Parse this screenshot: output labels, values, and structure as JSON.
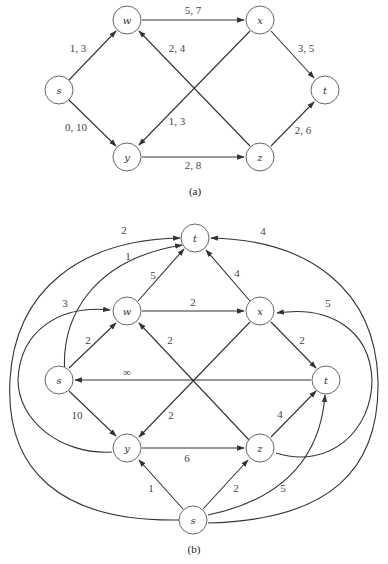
{
  "figure_a": {
    "caption": "(a)",
    "nodes": [
      {
        "id": "s",
        "label": "s"
      },
      {
        "id": "w",
        "label": "w"
      },
      {
        "id": "x",
        "label": "x"
      },
      {
        "id": "t",
        "label": "t"
      },
      {
        "id": "y",
        "label": "y"
      },
      {
        "id": "z",
        "label": "z"
      }
    ],
    "edges": [
      {
        "from": "s",
        "to": "w",
        "label": "1, 3"
      },
      {
        "from": "s",
        "to": "y",
        "label": "0, 10"
      },
      {
        "from": "w",
        "to": "x",
        "label": "5, 7"
      },
      {
        "from": "z",
        "to": "w",
        "label": "2, 4"
      },
      {
        "from": "x",
        "to": "y",
        "label": "1, 3"
      },
      {
        "from": "x",
        "to": "t",
        "label": "3, 5"
      },
      {
        "from": "y",
        "to": "z",
        "label": "2, 8"
      },
      {
        "from": "z",
        "to": "t",
        "label": "2, 6"
      }
    ]
  },
  "figure_b": {
    "caption": "(b)",
    "nodes": [
      {
        "id": "T",
        "label": "t"
      },
      {
        "id": "w",
        "label": "w"
      },
      {
        "id": "x",
        "label": "x"
      },
      {
        "id": "s",
        "label": "s"
      },
      {
        "id": "t",
        "label": "t"
      },
      {
        "id": "y",
        "label": "y"
      },
      {
        "id": "z",
        "label": "z"
      },
      {
        "id": "S",
        "label": "s"
      }
    ],
    "edges": [
      {
        "from": "S",
        "to": "T",
        "label": "2"
      },
      {
        "from": "s",
        "to": "T",
        "label": "1"
      },
      {
        "from": "w",
        "to": "T",
        "label": "5"
      },
      {
        "from": "x",
        "to": "T",
        "label": "4"
      },
      {
        "from": "S",
        "to": "T",
        "label": "4",
        "side": "right"
      },
      {
        "from": "y",
        "to": "w",
        "label": "3"
      },
      {
        "from": "s",
        "to": "w",
        "label": "2"
      },
      {
        "from": "w",
        "to": "x",
        "label": "2"
      },
      {
        "from": "z",
        "to": "w",
        "label": "2"
      },
      {
        "from": "z",
        "to": "x",
        "label": "5"
      },
      {
        "from": "x",
        "to": "t",
        "label": "2"
      },
      {
        "from": "t",
        "to": "s",
        "label": "∞"
      },
      {
        "from": "s",
        "to": "y",
        "label": "10"
      },
      {
        "from": "x",
        "to": "y",
        "label": "2"
      },
      {
        "from": "y",
        "to": "z",
        "label": "6"
      },
      {
        "from": "z",
        "to": "t",
        "label": "4"
      },
      {
        "from": "S",
        "to": "y",
        "label": "1"
      },
      {
        "from": "S",
        "to": "z",
        "label": "2"
      },
      {
        "from": "S",
        "to": "t",
        "label": "5"
      }
    ]
  }
}
